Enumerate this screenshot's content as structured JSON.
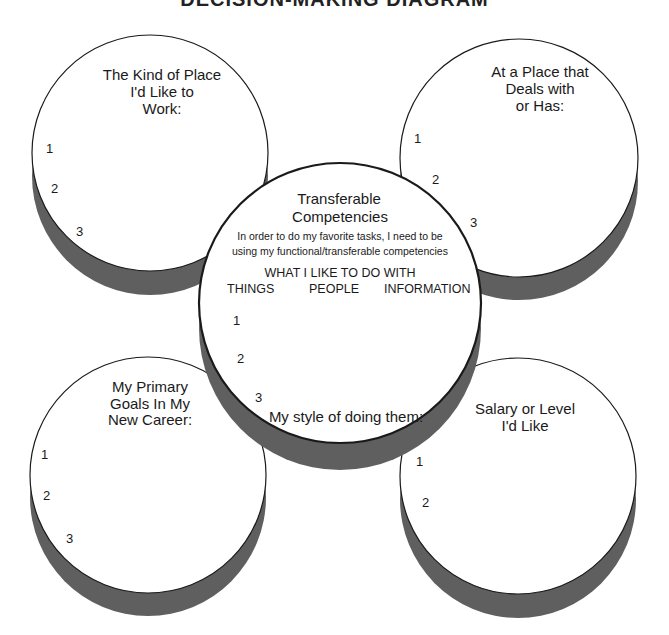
{
  "page_title": "DECISION-MAKING DIAGRAM",
  "colors": {
    "face": "#ffffff",
    "outline": "#1a1a1a",
    "shadow": "#5f5f5f"
  },
  "circles": {
    "top_left": {
      "title_lines": [
        "The Kind of Place",
        "I'd Like to",
        "Work:"
      ],
      "numbers": [
        "1",
        "2",
        "3"
      ]
    },
    "top_right": {
      "title_lines": [
        "At a Place that",
        "Deals with",
        "or Has:"
      ],
      "numbers": [
        "1",
        "2",
        "3"
      ]
    },
    "center": {
      "title_lines": [
        "Transferable",
        "Competencies"
      ],
      "subtitle_lines": [
        "In order to do my favorite tasks, I need to be",
        "using my functional/transferable competencies"
      ],
      "what_heading": "WHAT I LIKE TO DO WITH",
      "columns": [
        "THINGS",
        "PEOPLE",
        "INFORMATION"
      ],
      "numbers": [
        "1",
        "2",
        "3"
      ],
      "style_label": "My style of doing them:"
    },
    "bottom_left": {
      "title_lines": [
        "My Primary",
        "Goals In My",
        "New Career:"
      ],
      "numbers": [
        "1",
        "2",
        "3"
      ]
    },
    "bottom_right": {
      "title_lines": [
        "Salary or Level",
        "I'd Like"
      ],
      "numbers": [
        "1",
        "2"
      ]
    }
  }
}
